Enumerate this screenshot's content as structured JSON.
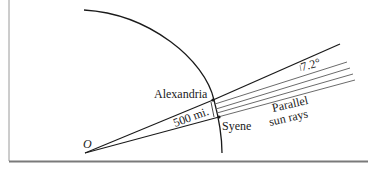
{
  "diagram": {
    "center_label": "O",
    "cities": [
      {
        "name": "Alexandria"
      },
      {
        "name": "Syene"
      }
    ],
    "distance_label": "500 mi.",
    "angle_label": "7.2°",
    "rays_label_line1": "Parallel",
    "rays_label_line2": "sun rays",
    "colors": {
      "ink": "#1a1a1a",
      "rays": "#6b6b6b",
      "border": "#8a8a8a"
    }
  }
}
